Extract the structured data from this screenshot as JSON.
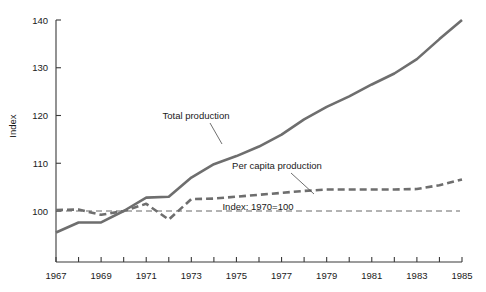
{
  "chart_data": {
    "type": "line",
    "title": "",
    "subtitle": "",
    "xlabel": "",
    "ylabel": "Index",
    "xlim": [
      1967,
      1985
    ],
    "ylim": [
      94,
      141
    ],
    "grid": false,
    "legend_position": "inline-annotations",
    "x": [
      1967,
      1968,
      1969,
      1970,
      1971,
      1972,
      1973,
      1974,
      1975,
      1976,
      1977,
      1978,
      1979,
      1980,
      1981,
      1982,
      1983,
      1984,
      1985
    ],
    "y_ticks": [
      100,
      110,
      120,
      130,
      140
    ],
    "x_ticks": [
      1967,
      1968,
      1969,
      1970,
      1971,
      1972,
      1973,
      1974,
      1975,
      1976,
      1977,
      1978,
      1979,
      1980,
      1981,
      1982,
      1983,
      1984,
      1985
    ],
    "x_tick_labels": [
      "1967",
      "",
      "1969",
      "",
      "1971",
      "",
      "1973",
      "",
      "1975",
      "",
      "1977",
      "",
      "1979",
      "",
      "1981",
      "",
      "1983",
      "",
      "1985"
    ],
    "series": [
      {
        "name": "Total production",
        "style": "solid",
        "color": "#6e6e6e",
        "values": [
          95.5,
          97.6,
          97.6,
          100.0,
          102.8,
          103.0,
          107.0,
          109.8,
          111.5,
          113.5,
          116.0,
          119.2,
          121.8,
          124.0,
          126.5,
          128.8,
          131.8,
          136.0,
          140.0
        ]
      },
      {
        "name": "Per capita production",
        "style": "dashed",
        "color": "#6e6e6e",
        "values": [
          100.2,
          100.3,
          99.2,
          100.0,
          101.5,
          98.2,
          102.5,
          102.6,
          103.0,
          103.4,
          103.8,
          104.2,
          104.5,
          104.5,
          104.5,
          104.5,
          104.6,
          105.4,
          106.6
        ]
      }
    ],
    "annotations": [
      {
        "name": "total-production-label",
        "text": "Total production",
        "x_px": 196,
        "y_px": 119,
        "leader_to_x": 222,
        "leader_to_y": 144
      },
      {
        "name": "per-capita-production-label",
        "text": "Per capita production",
        "x_px": 277,
        "y_px": 169,
        "leader_to_x": 314,
        "leader_to_y": 194
      },
      {
        "name": "index-baseline-note",
        "text": "Index: 1970=100",
        "x_px": 258,
        "y_px": 210
      }
    ],
    "baseline": {
      "value": 100,
      "style": "dashed",
      "label": "Index: 1970=100"
    }
  }
}
